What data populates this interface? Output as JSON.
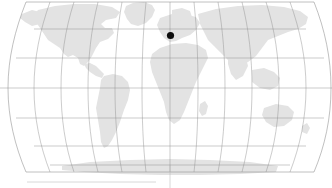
{
  "figure": {
    "title": "",
    "type": "world-map",
    "projection": "robinson",
    "background_color": "#ffffff",
    "land_color": "#e3e3e3",
    "graticule_color": "#8c8c8c",
    "marker_color": "#0d0d0d",
    "axis_color": "#b9b9b9"
  },
  "chart_data": {
    "type": "scatter",
    "title": "",
    "xlabel": "",
    "ylabel": "",
    "projection": "robinson",
    "xlim": [
      -180,
      180
    ],
    "ylim": [
      -90,
      90
    ],
    "grid": true,
    "graticule": {
      "meridian_step_deg": 30,
      "parallel_step_deg": 30,
      "meridians_deg": [
        -180,
        -150,
        -120,
        -90,
        -60,
        -30,
        0,
        30,
        60,
        90,
        120,
        150,
        180
      ],
      "parallels_deg": [
        -60,
        -30,
        0,
        30,
        60
      ]
    },
    "legend": null,
    "points": [
      {
        "name": "marker-1",
        "lon": 1.5,
        "lat": 52.5,
        "px": 170.5,
        "py": 35.5,
        "radius_px": 3.6,
        "color": "#0d0d0d"
      }
    ],
    "annotations": []
  },
  "map": {
    "center_x_px": 170,
    "left_edge_px": 8,
    "right_edge_px": 331,
    "equator_y_px": 88,
    "marker_label": "",
    "landmasses": [
      "north-america",
      "south-america",
      "africa",
      "europe",
      "asia",
      "australia",
      "antarctica",
      "greenland"
    ]
  },
  "axes": {
    "bottom_rule_visible": true,
    "bottom_rule_x1_px": 27,
    "bottom_rule_x2_px": 156,
    "bottom_rule_y_px": 182,
    "center_spine_visible": true,
    "center_spine_x_px": 170,
    "center_spine_y1_px": 165,
    "center_spine_y2_px": 188,
    "tick_labels": []
  }
}
